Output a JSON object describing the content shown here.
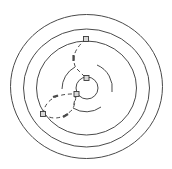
{
  "diagram": {
    "title": "",
    "colors": {
      "background": "#ffffff",
      "stroke": "#4a4a4a",
      "node_fill": "#d8d8d8"
    },
    "rings": [
      {
        "id": "outer-ring"
      },
      {
        "id": "second-ring"
      },
      {
        "id": "third-ring"
      },
      {
        "id": "inner-circle"
      }
    ],
    "arcs": [
      {
        "id": "right-arc"
      },
      {
        "id": "left-arc"
      },
      {
        "id": "bottom-arc"
      }
    ],
    "nodes": [
      {
        "id": "node-top"
      },
      {
        "id": "node-inner-top"
      },
      {
        "id": "node-inner-left"
      },
      {
        "id": "node-left"
      }
    ],
    "paths": [
      {
        "id": "path-top-to-left-arc",
        "style": "dashed"
      },
      {
        "id": "path-left-arc-to-inner-top",
        "style": "dashed"
      },
      {
        "id": "loop-upper",
        "style": "dashed"
      },
      {
        "id": "loop-lower",
        "style": "dashed"
      },
      {
        "id": "path-inner-left-to-bottom-arc",
        "style": "dashed"
      }
    ]
  }
}
